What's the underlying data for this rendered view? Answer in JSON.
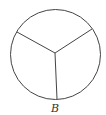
{
  "diagram": {
    "label": "B",
    "circle": {
      "cx": 55.5,
      "cy": 54.5,
      "r": 45,
      "stroke": "#444444"
    },
    "center": {
      "x": 55,
      "y": 53
    },
    "spokes": [
      {
        "x": 17,
        "y": 32
      },
      {
        "x": 92,
        "y": 29
      },
      {
        "x": 57,
        "y": 99
      }
    ]
  }
}
